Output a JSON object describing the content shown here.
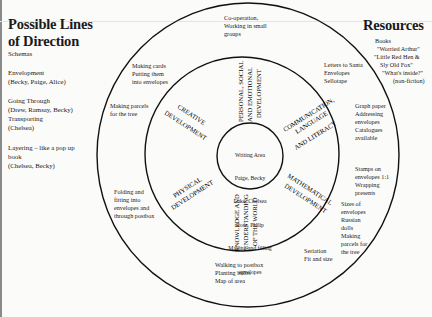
{
  "left_panel": {
    "title_line1": "Possible Lines",
    "title_line2": "of Direction",
    "subtitle": "Schemas",
    "schemas": [
      {
        "name": "Envelopment",
        "children": "(Becky, Paige, Alice)"
      },
      {
        "name": "Going Through",
        "children": "(Drew, Ramsay, Becky)"
      },
      {
        "name": "Transporting",
        "children": "(Chelsea)"
      },
      {
        "name": "Layering – like a pop up",
        "name2": "book",
        "children": "(Chelsea, Becky)"
      }
    ]
  },
  "right_panel": {
    "title": "Resources",
    "books_label": "Books",
    "books": [
      "\"Worried Arthur\"",
      "\"Little Red Hen &",
      "Sly Old Fox\"",
      "\"What's inside?\"",
      "(non-fiction)"
    ]
  },
  "diagram": {
    "centre": {
      "lines": [
        "Writing Area",
        "Paige, Becky",
        "Luke, Chelsea",
        "Ross, Philip",
        "Making and filling",
        "envelopes"
      ]
    },
    "areas": [
      {
        "id": "pse",
        "lines": [
          "PERSONAL, SOCIAL",
          "AND EMOTIONAL",
          "DEVELOPMENT"
        ]
      },
      {
        "id": "cll",
        "lines": [
          "COMMUNICATION,",
          "LANGUAGE",
          "AND LITERACY"
        ]
      },
      {
        "id": "math",
        "lines": [
          "MATHEMATICAL",
          "DEVELOPMENT"
        ]
      },
      {
        "id": "kuw",
        "lines": [
          "KNOWLEDGE AND",
          "UNDERSTANDING",
          "OF THE WORLD"
        ]
      },
      {
        "id": "phys",
        "lines": [
          "PHYSICAL",
          "DEVELOPMENT"
        ]
      },
      {
        "id": "creative",
        "lines": [
          "CREATIVE",
          "DEVELOPMENT"
        ]
      }
    ],
    "outer_notes": {
      "pse": "Co-operation,\nWorking in small\ngroups",
      "creative_top": "Making cards\nPutting them\ninto envelopes",
      "creative_side": "Making parcels\nfor the tree",
      "phys": "Folding and\nfitting into\nenvelopes and\nthrough postbox",
      "kuw": "Walking to postbox\nPlanting bulbs\nMap of area",
      "math_bottom": "Seriation\nFit and size",
      "math_side": "Sizes of\nenvelopes\nRussian\ndolls\nMaking\nparcels for\nthe tree",
      "math_top": "Stamps on\nenvelopes 1:1\nWrapping\npresents",
      "cll_side": "Graph paper\nAddressing\nenvelopes\nCatalogues\navailable",
      "cll_top": "Letters to Santa\nEnvelopes\nSellotape"
    }
  }
}
